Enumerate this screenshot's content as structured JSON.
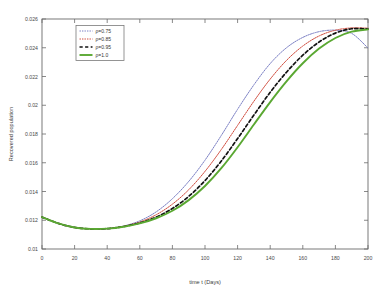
{
  "figure": {
    "background_color": "#ffffff",
    "outer_background_color": "#f2f2f0",
    "frame_color": "#6b6b6b"
  },
  "chart_data": {
    "type": "line",
    "title": "",
    "xlabel": "time t (Days)",
    "ylabel": "Recovered population",
    "xlim": [
      0,
      200
    ],
    "ylim": [
      0.01,
      0.026
    ],
    "grid": false,
    "legend_position": "upper left",
    "xticks": [
      0,
      20,
      40,
      60,
      80,
      100,
      120,
      140,
      160,
      180,
      200
    ],
    "xtick_labels": [
      "0",
      "20",
      "40",
      "60",
      "80",
      "100",
      "120",
      "140",
      "160",
      "180",
      "200"
    ],
    "yticks": [
      0.01,
      0.012,
      0.014,
      0.016,
      0.018,
      0.02,
      0.022,
      0.024,
      0.026
    ],
    "ytick_labels": [
      "0.01",
      "0.012",
      "0.014",
      "0.016",
      "0.018",
      "0.02",
      "0.022",
      "0.024",
      "0.026"
    ],
    "x": [
      0,
      10,
      20,
      30,
      40,
      50,
      60,
      70,
      80,
      90,
      100,
      110,
      120,
      130,
      140,
      150,
      160,
      170,
      180,
      190,
      200
    ],
    "series": [
      {
        "name": "ρ=0.75",
        "color": "#7b7fc4",
        "style": "dotted",
        "values": [
          0.01222,
          0.01178,
          0.0115,
          0.0114,
          0.01142,
          0.0116,
          0.01196,
          0.01258,
          0.0135,
          0.0147,
          0.01618,
          0.0179,
          0.01972,
          0.02142,
          0.0229,
          0.024,
          0.02472,
          0.02512,
          0.02522,
          0.025,
          0.02398
        ]
      },
      {
        "name": "ρ=0.85",
        "color": "#d04a3c",
        "style": "dotted",
        "values": [
          0.01222,
          0.01178,
          0.0115,
          0.0114,
          0.01142,
          0.01158,
          0.01188,
          0.01238,
          0.01312,
          0.01412,
          0.0154,
          0.01692,
          0.0186,
          0.02028,
          0.02182,
          0.02312,
          0.02412,
          0.02482,
          0.02522,
          0.02538,
          0.02536
        ]
      },
      {
        "name": "ρ=0.95",
        "color": "#111111",
        "style": "dashed",
        "values": [
          0.01222,
          0.01178,
          0.0115,
          0.0114,
          0.01142,
          0.01156,
          0.01182,
          0.01222,
          0.01282,
          0.01366,
          0.01476,
          0.01612,
          0.01768,
          0.01932,
          0.0209,
          0.0223,
          0.02348,
          0.0244,
          0.02502,
          0.02532,
          0.0253
        ]
      },
      {
        "name": "ρ=1.0",
        "color": "#5aa832",
        "style": "solid",
        "values": [
          0.01222,
          0.01178,
          0.0115,
          0.0114,
          0.01142,
          0.01155,
          0.01178,
          0.01214,
          0.01266,
          0.0134,
          0.01438,
          0.01562,
          0.01708,
          0.01866,
          0.02022,
          0.02166,
          0.02292,
          0.02394,
          0.02468,
          0.02512,
          0.02528
        ]
      }
    ],
    "legend_entries": [
      {
        "label": "ρ=0.75",
        "color": "#7b7fc4",
        "style": "dotted"
      },
      {
        "label": "ρ=0.85",
        "color": "#d04a3c",
        "style": "dotted"
      },
      {
        "label": "ρ=0.95",
        "color": "#111111",
        "style": "dashed"
      },
      {
        "label": "ρ=1.0",
        "color": "#5aa832",
        "style": "solid"
      }
    ]
  }
}
